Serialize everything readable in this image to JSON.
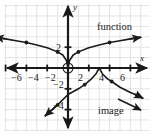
{
  "figure": {
    "background": "#ffffff",
    "grid_color": "#d9d9d9",
    "axis_color": "#1a1a1a",
    "curve_color": "#1a1a1a"
  },
  "axes": {
    "x_label": "x",
    "y_label": "y",
    "x_ticks": [
      {
        "value": -6,
        "label": "−6"
      },
      {
        "value": -4,
        "label": "−4"
      },
      {
        "value": -2,
        "label": "−2"
      },
      {
        "value": 2,
        "label": "2"
      },
      {
        "value": 4,
        "label": "4"
      },
      {
        "value": 6,
        "label": "6"
      }
    ],
    "y_ticks": [
      {
        "value": 2,
        "label": "2"
      },
      {
        "value": -2,
        "label": "−2"
      },
      {
        "value": -4,
        "label": "−4"
      }
    ]
  },
  "annotations": [
    {
      "name": "function-label",
      "text": "function"
    },
    {
      "name": "image-label",
      "text": "image"
    }
  ],
  "chart_data": {
    "type": "line",
    "title": "",
    "xlabel": "x",
    "ylabel": "y",
    "xlim": [
      -7.2,
      7.6
    ],
    "ylim": [
      -5.8,
      6.2
    ],
    "grid": true,
    "grid_step": 1,
    "legend": "annotation-labels",
    "series": [
      {
        "name": "function",
        "label": "function",
        "style": "solid",
        "arrows": [
          "left-end",
          "right-end"
        ],
        "open_circle_at": [
          0,
          0
        ],
        "markers": [
          [
            -4,
            2.45
          ],
          [
            -1,
            1.55
          ],
          [
            1,
            1.55
          ],
          [
            4,
            2.45
          ]
        ],
        "x": [
          -7.0,
          -6.0,
          -5.0,
          -4.0,
          -3.0,
          -2.0,
          -1.0,
          -0.5,
          -0.15,
          0,
          0.15,
          0.5,
          1.0,
          2.0,
          3.0,
          4.0,
          5.0,
          6.0,
          7.0
        ],
        "y": [
          2.95,
          2.8,
          2.62,
          2.45,
          2.22,
          1.95,
          1.55,
          1.25,
          0.72,
          0,
          0.72,
          1.25,
          1.55,
          1.95,
          2.22,
          2.45,
          2.62,
          2.8,
          2.95
        ]
      },
      {
        "name": "image",
        "label": "image",
        "style": "solid",
        "arrows": [
          "left-end",
          "right-end"
        ],
        "peak": [
          3,
          0
        ],
        "markers": [
          [
            -1,
            -3.55
          ],
          [
            1.6,
            -1.6
          ],
          [
            4.2,
            -1.3
          ],
          [
            6.6,
            -2.6
          ]
        ],
        "x": [
          -2.2,
          -1.0,
          0.0,
          1.0,
          1.6,
          2.2,
          2.7,
          3.0,
          3.3,
          3.8,
          4.2,
          5.0,
          6.0,
          6.6,
          7.2
        ],
        "y": [
          -4.6,
          -3.55,
          -2.55,
          -2.0,
          -1.6,
          -1.1,
          -0.55,
          0.0,
          -0.55,
          -1.05,
          -1.3,
          -1.85,
          -2.35,
          -2.6,
          -2.9
        ]
      }
    ]
  },
  "label_positions": {
    "function": {
      "left": 97,
      "top": 22
    },
    "image": {
      "left": 98,
      "top": 106
    },
    "x_axis": {
      "left": 140,
      "top": 54
    },
    "y_axis": {
      "left": 73,
      "top": 3
    },
    "tick_neg6": {
      "left": 11,
      "top": 73
    },
    "tick_neg4": {
      "left": 28,
      "top": 73
    },
    "tick_neg2": {
      "left": 45,
      "top": 73
    },
    "tick_2": {
      "left": 78,
      "top": 73
    },
    "tick_4": {
      "left": 99,
      "top": 73
    },
    "tick_6": {
      "left": 120,
      "top": 73
    },
    "tick_y2": {
      "left": 56,
      "top": 43
    },
    "tick_yneg2": {
      "left": 53,
      "top": 80
    },
    "tick_yneg4": {
      "left": 53,
      "top": 101
    }
  }
}
